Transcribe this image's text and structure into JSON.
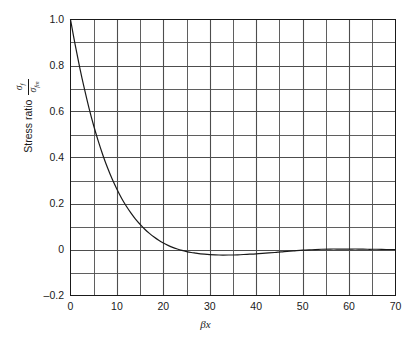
{
  "figure": {
    "background": "#ffffff",
    "axis_color": "#1a1a1a",
    "grid_color": "#4d4d4d",
    "curve_color": "#1a1a1a"
  },
  "axes": {
    "x_label": "βx",
    "y_label_prefix": "Stress ratio",
    "y_label_numerator_symbol": "σ",
    "y_label_numerator_sub": "f",
    "y_label_denominator_symbol": "σ",
    "y_label_denominator_sub": "fm",
    "x_ticks": [
      "0",
      "10",
      "20",
      "30",
      "40",
      "50",
      "60",
      "70"
    ],
    "y_ticks": [
      "1.0",
      "0.8",
      "0.6",
      "0.4",
      "0.2",
      "0",
      "–0.2"
    ]
  },
  "chart_data": {
    "type": "line",
    "title": "",
    "xlabel": "βx",
    "ylabel": "Stress ratio σf / σfm",
    "xlim": [
      0,
      70
    ],
    "ylim": [
      -0.2,
      1.0
    ],
    "x_major_step": 10,
    "x_grid_step": 5,
    "y_major_step": 0.2,
    "y_grid_step": 0.1,
    "grid": true,
    "legend": "none",
    "series": [
      {
        "name": "stress ratio",
        "x": [
          0,
          1,
          2,
          3,
          4,
          5,
          6,
          7,
          8,
          9,
          10,
          11,
          12,
          13,
          14,
          15,
          16,
          17,
          18,
          19,
          20,
          21,
          22,
          23,
          24,
          25,
          26,
          27,
          28,
          30,
          32,
          34,
          36,
          38,
          40,
          42,
          44,
          45,
          46,
          48,
          50,
          52,
          54,
          56,
          58,
          60,
          62,
          64,
          66,
          68,
          70
        ],
        "y": [
          1.0,
          0.891,
          0.79,
          0.698,
          0.614,
          0.538,
          0.47,
          0.409,
          0.354,
          0.305,
          0.262,
          0.223,
          0.189,
          0.159,
          0.132,
          0.109,
          0.088,
          0.07,
          0.054,
          0.04,
          0.028,
          0.018,
          0.009,
          0.002,
          -0.004,
          -0.009,
          -0.013,
          -0.016,
          -0.019,
          -0.022,
          -0.024,
          -0.024,
          -0.023,
          -0.021,
          -0.019,
          -0.016,
          -0.013,
          -0.011,
          -0.009,
          -0.006,
          -0.003,
          -0.001,
          0.001,
          0.002,
          0.002,
          0.002,
          0.002,
          0.001,
          0.001,
          0.0,
          0.0
        ]
      }
    ],
    "annotations": {
      "start_value": 1.0,
      "zero_crossing_beta_x": 16,
      "trough_value": -0.067,
      "trough_beta_x": 24,
      "second_zero_crossing_beta_x": 45,
      "secondary_peak_value": 0.006,
      "secondary_peak_beta_x": 53
    }
  }
}
